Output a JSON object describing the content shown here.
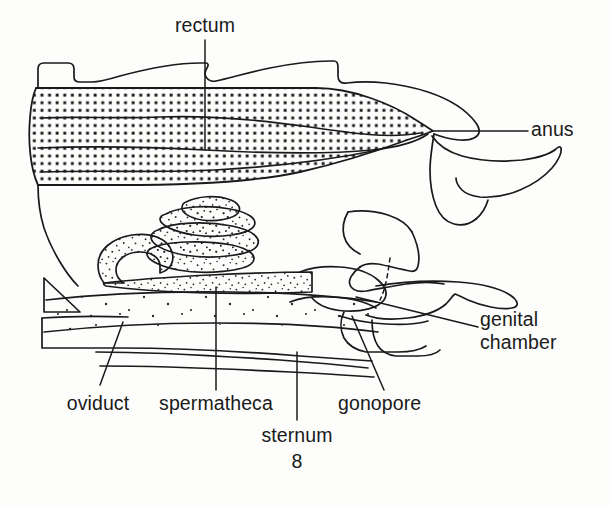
{
  "figure": {
    "kind": "anatomical-line-drawing",
    "background_color": "#fdfdfc",
    "line_color": "#1a1a1a",
    "stipple_color": "#1a1a1a"
  },
  "labels": {
    "rectum": "rectum",
    "anus": "anus",
    "genital_chamber_line1": "genital",
    "genital_chamber_line2": "chamber",
    "gonopore": "gonopore",
    "sternum_line1": "sternum",
    "sternum_line2": "8",
    "spermatheca": "spermatheca",
    "oviduct": "oviduct"
  },
  "structures": [
    {
      "name": "rectum",
      "fill": "grid-dot-stipple",
      "description": "large dotted organ upper abdomen tapering right to anus"
    },
    {
      "name": "anus",
      "fill": "none",
      "description": "opening at posterior tip of rectum"
    },
    {
      "name": "genital chamber",
      "fill": "none",
      "description": "cavity beneath sternum 8 right side"
    },
    {
      "name": "gonopore",
      "fill": "none",
      "description": "opening of oviduct into genital chamber"
    },
    {
      "name": "sternum 8",
      "fill": "none",
      "description": "ventral plate segment 8"
    },
    {
      "name": "spermatheca",
      "fill": "fine-random-stipple",
      "description": "coiled sperm storage tube, mid abdomen"
    },
    {
      "name": "oviduct",
      "fill": "sparse-stipple",
      "description": "duct running along ventral side"
    }
  ],
  "leaders": [
    {
      "for": "rectum",
      "type": "vertical"
    },
    {
      "for": "anus",
      "type": "horizontal"
    },
    {
      "for": "genital_chamber",
      "type": "diagonal"
    },
    {
      "for": "gonopore",
      "type": "diagonal"
    },
    {
      "for": "sternum",
      "type": "vertical"
    },
    {
      "for": "spermatheca",
      "type": "vertical"
    },
    {
      "for": "oviduct",
      "type": "diagonal"
    }
  ]
}
